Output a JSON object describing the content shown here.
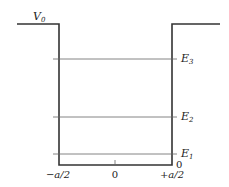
{
  "diagram": {
    "potential_label": "V",
    "potential_subscript": "0",
    "colors": {
      "well": "#333333",
      "levels": "#666666",
      "text": "#222222",
      "background": "#ffffff"
    },
    "energy_levels": [
      {
        "label": "E",
        "subscript": "3",
        "y": 59
      },
      {
        "label": "E",
        "subscript": "2",
        "y": 117
      },
      {
        "label": "E",
        "subscript": "1",
        "y": 154
      }
    ],
    "bottom_value_label": "0",
    "x_axis": {
      "ticks": [
        {
          "label": "−a/2",
          "x": 58
        },
        {
          "label": "0",
          "x": 115
        },
        {
          "label": "+a/2",
          "x": 172
        }
      ]
    }
  }
}
